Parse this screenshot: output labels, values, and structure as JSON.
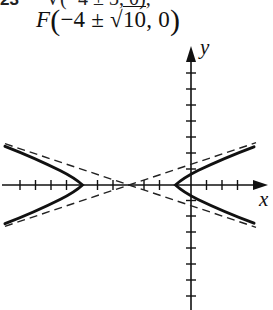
{
  "header": {
    "cut_line_number": "23",
    "cut_line_text": "V(−4 ± 3, 0);",
    "foci_label": "F",
    "foci_x_center": "−4",
    "foci_pm": "±",
    "foci_radicand": "10",
    "foci_y": "0"
  },
  "graph": {
    "x_axis_label": "x",
    "y_axis_label": "y",
    "center": [
      -4,
      0
    ],
    "a": 3,
    "b": 1,
    "c_squared": 10,
    "vertices": [
      "(-7, 0)",
      "(-1, 0)"
    ],
    "asymptote_slopes": [
      "1/3",
      "-1/3"
    ],
    "x_tick_range": [
      -12,
      4
    ],
    "y_tick_range": [
      -7,
      8
    ],
    "colors": {
      "curve": "#111111",
      "axis": "#111111",
      "asymptote": "#222222"
    }
  }
}
